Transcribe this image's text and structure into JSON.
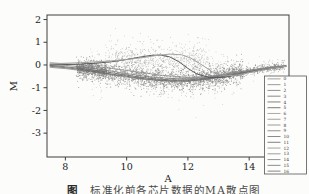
{
  "figure": {
    "background": "#fcfcfa",
    "caption": {
      "bold": "图",
      "rest": "　标准化前各芯片数据的MA散点图"
    }
  },
  "chart_data": {
    "type": "scatter",
    "title": "",
    "xlabel": "A",
    "ylabel": "M",
    "xlim": [
      7.4,
      15.3
    ],
    "ylim": [
      -4.05,
      2.2
    ],
    "x_ticks": [
      8,
      10,
      12,
      14
    ],
    "y_ticks": [
      2,
      1,
      0,
      -1,
      -2,
      -3
    ],
    "grid": false,
    "frame_color": "#3f3f3f",
    "text_color": "#222222",
    "plot_area_px": {
      "left": 47,
      "top": 15,
      "right": 289,
      "bottom": 157
    },
    "seed": 42,
    "band_center": {
      "x": [
        7.5,
        8.0,
        8.5,
        9.0,
        9.5,
        10.0,
        10.5,
        11.0,
        11.5,
        12.0,
        12.5,
        13.0,
        13.5,
        14.0,
        14.5,
        15.2
      ],
      "y": [
        -0.02,
        -0.08,
        -0.15,
        -0.24,
        -0.34,
        -0.45,
        -0.55,
        -0.62,
        -0.66,
        -0.66,
        -0.6,
        -0.5,
        -0.38,
        -0.27,
        -0.16,
        -0.04
      ]
    },
    "loess_curves": [
      {
        "name": "band-fit-1",
        "color": "#6e6e6e",
        "width": 0.9,
        "x": [
          7.5,
          8.0,
          8.5,
          9.0,
          9.5,
          10.0,
          10.5,
          11.0,
          11.5,
          12.0,
          12.5,
          13.0,
          13.5,
          14.0,
          14.5,
          15.2
        ],
        "y": [
          -0.02,
          -0.08,
          -0.15,
          -0.24,
          -0.34,
          -0.45,
          -0.55,
          -0.62,
          -0.66,
          -0.66,
          -0.6,
          -0.5,
          -0.38,
          -0.27,
          -0.16,
          -0.04
        ]
      },
      {
        "name": "band-fit-2",
        "color": "#7d7d7d",
        "width": 0.8,
        "x": [
          7.5,
          8.0,
          8.5,
          9.0,
          9.5,
          10.0,
          10.5,
          11.0,
          11.5,
          12.0,
          12.5,
          13.0,
          13.5,
          14.0,
          14.5,
          15.2
        ],
        "y": [
          0.02,
          -0.02,
          -0.08,
          -0.17,
          -0.27,
          -0.38,
          -0.48,
          -0.55,
          -0.6,
          -0.61,
          -0.56,
          -0.46,
          -0.34,
          -0.23,
          -0.13,
          -0.02
        ]
      },
      {
        "name": "band-fit-3",
        "color": "#606060",
        "width": 0.8,
        "x": [
          7.5,
          8.0,
          8.5,
          9.0,
          9.5,
          10.0,
          10.5,
          11.0,
          11.5,
          12.0,
          12.5,
          13.0,
          13.5,
          14.0,
          14.5,
          15.2
        ],
        "y": [
          -0.06,
          -0.12,
          -0.2,
          -0.3,
          -0.4,
          -0.5,
          -0.6,
          -0.67,
          -0.7,
          -0.7,
          -0.64,
          -0.54,
          -0.42,
          -0.3,
          -0.18,
          -0.06
        ]
      },
      {
        "name": "band-fit-4",
        "color": "#747474",
        "width": 0.7,
        "x": [
          7.5,
          8.0,
          8.5,
          9.0,
          9.5,
          10.0,
          10.5,
          11.0,
          11.5,
          12.0,
          12.5,
          13.0,
          13.5,
          14.0,
          14.5,
          15.2
        ],
        "y": [
          -0.1,
          -0.16,
          -0.24,
          -0.33,
          -0.43,
          -0.53,
          -0.62,
          -0.68,
          -0.72,
          -0.71,
          -0.65,
          -0.55,
          -0.43,
          -0.3,
          -0.18,
          -0.07
        ]
      },
      {
        "name": "gentle-fit",
        "color": "#8a8a8a",
        "width": 0.8,
        "x": [
          7.5,
          8.0,
          8.5,
          9.0,
          9.5,
          10.0,
          10.5,
          11.0,
          11.5,
          12.0,
          12.5,
          13.0,
          13.5,
          14.0,
          14.5,
          15.2
        ],
        "y": [
          0.1,
          0.05,
          0.0,
          -0.07,
          -0.15,
          -0.24,
          -0.33,
          -0.43,
          -0.5,
          -0.55,
          -0.53,
          -0.45,
          -0.35,
          -0.25,
          -0.15,
          -0.05
        ]
      },
      {
        "name": "hump-fit-dark",
        "color": "#5a5a5a",
        "width": 1.0,
        "x": [
          7.5,
          8.5,
          9.0,
          9.5,
          10.0,
          10.4,
          10.8,
          11.1,
          11.4,
          11.7,
          12.0,
          12.3,
          12.7,
          13.1,
          13.6,
          14.0,
          14.5,
          15.2
        ],
        "y": [
          0.0,
          0.04,
          0.08,
          0.14,
          0.24,
          0.34,
          0.42,
          0.44,
          0.36,
          0.15,
          -0.15,
          -0.4,
          -0.55,
          -0.55,
          -0.45,
          -0.32,
          -0.2,
          -0.06
        ]
      },
      {
        "name": "hump-fit-light",
        "color": "#a3a3a3",
        "width": 1.0,
        "x": [
          7.5,
          8.5,
          9.5,
          10.0,
          10.5,
          11.0,
          11.4,
          11.8,
          12.1,
          12.4,
          12.8,
          13.2,
          13.6,
          14.0,
          14.5,
          15.2
        ],
        "y": [
          0.05,
          0.1,
          0.18,
          0.24,
          0.32,
          0.42,
          0.48,
          0.45,
          0.3,
          0.05,
          -0.3,
          -0.48,
          -0.45,
          -0.33,
          -0.2,
          -0.06
        ]
      }
    ],
    "scatter_clouds": [
      {
        "name": "left-clump",
        "n": 380,
        "x": [
          8.35,
          9.35
        ],
        "center": "band",
        "mode": "gauss",
        "spread": 0.13,
        "color": "#6b6b6b",
        "r": 0.5
      },
      {
        "name": "dense-main",
        "n": 1900,
        "x": [
          8.35,
          13.8
        ],
        "center": "band",
        "mode": "gauss",
        "spread": 0.26,
        "color": "#8b8b8b",
        "r": 0.5
      },
      {
        "name": "right-band",
        "n": 650,
        "x": [
          12.4,
          15.15
        ],
        "center": "band",
        "mode": "gauss",
        "spread": 0.1,
        "color": "#777777",
        "r": 0.45
      },
      {
        "name": "wide-halo",
        "n": 420,
        "x": [
          8.8,
          13.6
        ],
        "center": "band",
        "mode": "gauss",
        "spread": 0.5,
        "color": "#a8a8a8",
        "r": 0.45
      },
      {
        "name": "upper-halo",
        "n": 330,
        "x": [
          9.3,
          12.7
        ],
        "center": "flat",
        "base_y": 0.1,
        "mode": "up",
        "spread": 0.5,
        "color": "#a5a5a5",
        "r": 0.45
      },
      {
        "name": "upper-mid",
        "n": 260,
        "x": [
          9.6,
          12.4
        ],
        "center": "flat",
        "base_y": -0.1,
        "mode": "up",
        "spread": 0.35,
        "color": "#9a9a9a",
        "r": 0.45
      },
      {
        "name": "right-sparse",
        "n": 60,
        "x": [
          13.8,
          15.15
        ],
        "center": "band",
        "mode": "gauss",
        "spread": 0.22,
        "color": "#9a9a9a",
        "r": 0.4
      }
    ],
    "legend": {
      "position": "right-bottom",
      "box_px": {
        "x": 264.5,
        "y": 76,
        "w": 42,
        "h": 98
      },
      "border_color": "#555555",
      "background": "#fdfdfc",
      "entries": [
        "0",
        "1",
        "2",
        "3",
        "4",
        "5",
        "6",
        "7",
        "8",
        "9",
        "10",
        "11",
        "12",
        "13",
        "14",
        "15",
        "16"
      ],
      "line_colors": [
        "#989898",
        "#8f8f8f",
        "#868686",
        "#7d7d7d",
        "#747474",
        "#6b6b6b",
        "#a0a0a0",
        "#979797",
        "#8e8e8e",
        "#858585",
        "#7c7c7c",
        "#737373",
        "#9b9b9b",
        "#929292",
        "#898989",
        "#808080",
        "#777777"
      ]
    }
  }
}
